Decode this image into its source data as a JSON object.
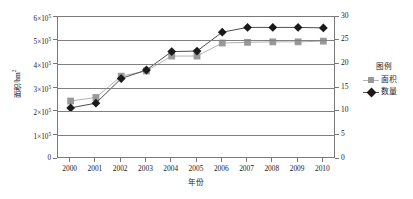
{
  "chart_data": {
    "type": "line",
    "title": "",
    "xlabel": "年份",
    "ylabel": "面积/hm²",
    "ylabel_right": "",
    "x": [
      "2000",
      "2001",
      "2002",
      "2003",
      "2004",
      "2005",
      "2006",
      "2007",
      "2008",
      "2009",
      "2010"
    ],
    "categories": [
      "2000",
      "2001",
      "2002",
      "2003",
      "2004",
      "2005",
      "2006",
      "2007",
      "2008",
      "2009",
      "2010"
    ],
    "ylim": [
      0,
      600000
    ],
    "ylim_right": [
      0,
      30
    ],
    "yticks": [
      "0",
      "1×10⁵",
      "2×10⁵",
      "3×10⁵",
      "4×10⁵",
      "5×10⁵",
      "6×10⁵"
    ],
    "ytick_values": [
      0,
      100000,
      200000,
      300000,
      400000,
      500000,
      600000
    ],
    "ytick_mantissa": [
      "0",
      "1",
      "2",
      "3",
      "4",
      "5",
      "6"
    ],
    "yticks_right": [
      "0",
      "5",
      "10",
      "15",
      "20",
      "25",
      "30"
    ],
    "ytick_right_values": [
      0,
      5,
      10,
      15,
      20,
      25,
      30
    ],
    "grid": true,
    "grid_axis": "y",
    "legend_position": "right",
    "legend_title": "图例",
    "series": [
      {
        "name": "面积",
        "axis": "left",
        "marker": "square",
        "color": "#999999",
        "line_color": "#b3b3b3",
        "values": [
          245000,
          260000,
          350000,
          372000,
          435000,
          435000,
          490000,
          493000,
          495000,
          495000,
          498000
        ]
      },
      {
        "name": "数量",
        "axis": "right",
        "marker": "diamond",
        "color": "#1a1a1a",
        "line_color": "#4d4d4d",
        "values": [
          10.8,
          11.8,
          17.0,
          18.8,
          22.7,
          22.8,
          26.8,
          27.8,
          27.8,
          27.8,
          27.7
        ]
      }
    ]
  },
  "axes": {
    "y_left_title": "面积/hm",
    "y_left_title_sup": "2",
    "x_title": "年份"
  },
  "legend": {
    "title": "图例",
    "items": [
      {
        "label": "面积",
        "marker": "square-marker",
        "color": "#999999"
      },
      {
        "label": "数量",
        "marker": "diamond-marker",
        "color": "#1a1a1a"
      }
    ]
  }
}
